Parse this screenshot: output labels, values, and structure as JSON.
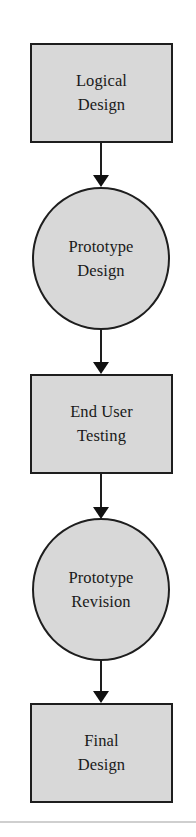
{
  "diagram": {
    "type": "flowchart",
    "direction": "top-to-bottom",
    "colors": {
      "node_fill": "#d8d8d8",
      "node_border": "#1e1e1e",
      "connector": "#1e1e1e",
      "text": "#1a1a1a",
      "divider": "#cfcfcf"
    },
    "nodes": [
      {
        "id": "logical-design",
        "shape": "rectangle",
        "label": "Logical\nDesign"
      },
      {
        "id": "prototype-design",
        "shape": "circle",
        "label": "Prototype\nDesign"
      },
      {
        "id": "end-user-testing",
        "shape": "rectangle",
        "label": "End User\nTesting"
      },
      {
        "id": "prototype-revision",
        "shape": "circle",
        "label": "Prototype\nRevision"
      },
      {
        "id": "final-design",
        "shape": "rectangle",
        "label": "Final\nDesign"
      }
    ],
    "edges": [
      {
        "from": "logical-design",
        "to": "prototype-design"
      },
      {
        "from": "prototype-design",
        "to": "end-user-testing"
      },
      {
        "from": "end-user-testing",
        "to": "prototype-revision"
      },
      {
        "from": "prototype-revision",
        "to": "final-design"
      }
    ]
  }
}
